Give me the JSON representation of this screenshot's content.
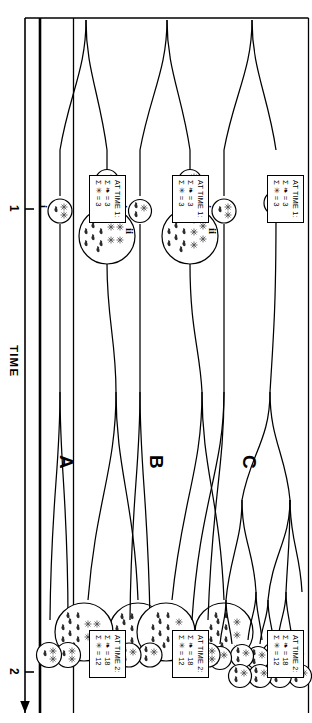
{
  "figure": {
    "title_hidden": "",
    "axis": {
      "name": "time-axis",
      "label": "TIME",
      "ticks": [
        "1",
        "2"
      ],
      "direction": "arrow-left-increasing"
    },
    "symbols": {
      "host": "✳",
      "host_name": "asterisk-flower-symbol",
      "parasite": "❧",
      "parasite_name": "bee-symbol"
    },
    "panels": [
      {
        "id": "A",
        "letter": "A",
        "legend_time1": {
          "title": "AT TIME 1:",
          "rows": [
            {
              "symbol": "bee",
              "relation": "=",
              "value": "3"
            },
            {
              "symbol": "flower",
              "relation": "=",
              "value": "3"
            }
          ]
        },
        "legend_time2": {
          "title": "AT TIME 2:",
          "rows": [
            {
              "symbol": "bee",
              "relation": "=",
              "value": "18"
            },
            {
              "symbol": "flower",
              "relation": "=",
              "value": "12"
            }
          ]
        },
        "lineages": [
          {
            "roman": "ii",
            "type": "expanding-bottleneck"
          },
          {
            "roman": "i",
            "type": "simple-split"
          }
        ]
      },
      {
        "id": "B",
        "letter": "B",
        "legend_time1": {
          "title": "AT TIME 1:",
          "rows": [
            {
              "symbol": "bee",
              "relation": "=",
              "value": "3"
            },
            {
              "symbol": "flower",
              "relation": "=",
              "value": "3"
            }
          ]
        },
        "legend_time2": {
          "title": "AT TIME 2:",
          "rows": [
            {
              "symbol": "bee",
              "relation": "=",
              "value": "18"
            },
            {
              "symbol": "flower",
              "relation": "=",
              "value": "12"
            }
          ]
        },
        "lineages": [
          {
            "roman": "ii",
            "type": "expanding-bottleneck"
          },
          {
            "roman": "i",
            "type": "simple-split"
          }
        ]
      },
      {
        "id": "C",
        "letter": "C",
        "legend_time1": {
          "title": "AT TIME 1:",
          "rows": [
            {
              "symbol": "bee",
              "relation": "=",
              "value": "3"
            },
            {
              "symbol": "flower",
              "relation": "=",
              "value": "3"
            }
          ]
        },
        "legend_time2": {
          "title": "AT TIME 2:",
          "rows": [
            {
              "symbol": "bee",
              "relation": "=",
              "value": "18"
            },
            {
              "symbol": "flower",
              "relation": "=",
              "value": "12"
            }
          ]
        },
        "lineages": [
          {
            "roman": "ii",
            "type": "repeated-cladogenesis"
          },
          {
            "roman": "i",
            "type": "simple-split"
          }
        ]
      }
    ],
    "colors": {
      "ink": "#000000",
      "paper": "#ffffff"
    }
  }
}
